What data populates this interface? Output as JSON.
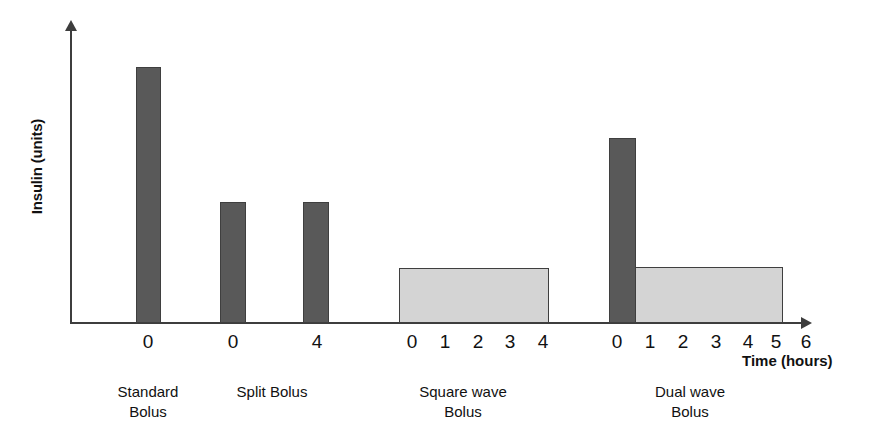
{
  "chart_data": {
    "type": "bar",
    "title": "",
    "subtitle": "",
    "xlabel": "Time (hours)",
    "ylabel": "Insulin (units)",
    "grid": false,
    "legend": "none",
    "xlim": [
      0,
      7
    ],
    "ylim": [
      0,
      10
    ],
    "note": "Schematic comparison of four insulin pump bolus delivery patterns; y-axis unlabeled (relative insulin units), x-axis shows hours after the bolus start for each pattern.",
    "groups": [
      {
        "name": "Standard Bolus",
        "caption_line1": "Standard",
        "caption_line2": "Bolus",
        "center_x": 148,
        "tick_labels": [
          "0"
        ],
        "bars": [
          {
            "label": "0",
            "kind": "immediate",
            "color": "#595959",
            "x_hours": 0,
            "duration_hours": 0.35,
            "value": 8.6
          }
        ]
      },
      {
        "name": "Split Bolus",
        "caption_line1": "Split Bolus",
        "caption_line2": "",
        "center_x": 272,
        "tick_labels": [
          "0",
          "4"
        ],
        "bars": [
          {
            "label": "0",
            "kind": "immediate",
            "color": "#595959",
            "x_hours": 0,
            "duration_hours": 0.35,
            "value": 4.0
          },
          {
            "label": "4",
            "kind": "immediate",
            "color": "#595959",
            "x_hours": 4,
            "duration_hours": 0.35,
            "value": 4.0
          }
        ]
      },
      {
        "name": "Square wave Bolus",
        "caption_line1": "Square wave",
        "caption_line2": "Bolus",
        "center_x": 463,
        "tick_labels": [
          "0",
          "1",
          "2",
          "3",
          "4"
        ],
        "bars": [
          {
            "label": "0-4",
            "kind": "extended",
            "color": "#d4d4d4",
            "x_hours": 0,
            "duration_hours": 4.5,
            "value": 1.8
          }
        ]
      },
      {
        "name": "Dual wave Bolus",
        "caption_line1": "Dual wave",
        "caption_line2": "Bolus",
        "center_x": 690,
        "tick_labels": [
          "0",
          "1",
          "2",
          "3",
          "4",
          "5",
          "6"
        ],
        "bars": [
          {
            "label": "0",
            "kind": "immediate",
            "color": "#595959",
            "x_hours": 0,
            "duration_hours": 0.9,
            "value": 6.2
          },
          {
            "label": "1-6",
            "kind": "extended",
            "color": "#d4d4d4",
            "x_hours": 1,
            "duration_hours": 5.5,
            "value": 1.85
          }
        ]
      }
    ],
    "colors": {
      "immediate_bolus": "#595959",
      "extended_bolus": "#d4d4d4",
      "axis": "#3d3d3d",
      "text": "#111111",
      "background": "#ffffff"
    }
  },
  "render": {
    "bars": [
      {
        "name": "bar-standard-0",
        "style": "bar-dark",
        "left": 136,
        "top": 67,
        "width": 25,
        "height": 256
      },
      {
        "name": "bar-split-0",
        "style": "bar-dark",
        "left": 220,
        "top": 202,
        "width": 26,
        "height": 121
      },
      {
        "name": "bar-split-4",
        "style": "bar-dark",
        "left": 303,
        "top": 202,
        "width": 26,
        "height": 121
      },
      {
        "name": "bar-squarewave-0-4",
        "style": "bar-light",
        "left": 399,
        "top": 268,
        "width": 150,
        "height": 55
      },
      {
        "name": "bar-dualwave-0",
        "style": "bar-dark",
        "left": 609,
        "top": 138,
        "width": 27,
        "height": 185
      },
      {
        "name": "bar-dualwave-1-6",
        "style": "bar-light",
        "left": 635,
        "top": 267,
        "width": 148,
        "height": 56
      }
    ],
    "ticks": [
      {
        "name": "tick-standard-0",
        "text": "0",
        "left": 148
      },
      {
        "name": "tick-split-0",
        "text": "0",
        "left": 233
      },
      {
        "name": "tick-split-4",
        "text": "4",
        "left": 317
      },
      {
        "name": "tick-square-0",
        "text": "0",
        "left": 412
      },
      {
        "name": "tick-square-1",
        "text": "1",
        "left": 445
      },
      {
        "name": "tick-square-2",
        "text": "2",
        "left": 478
      },
      {
        "name": "tick-square-3",
        "text": "3",
        "left": 510
      },
      {
        "name": "tick-square-4",
        "text": "4",
        "left": 543
      },
      {
        "name": "tick-dual-0",
        "text": "0",
        "left": 617
      },
      {
        "name": "tick-dual-1",
        "text": "1",
        "left": 650
      },
      {
        "name": "tick-dual-2",
        "text": "2",
        "left": 683
      },
      {
        "name": "tick-dual-3",
        "text": "3",
        "left": 716
      },
      {
        "name": "tick-dual-4",
        "text": "4",
        "left": 748
      },
      {
        "name": "tick-dual-5",
        "text": "5",
        "left": 776
      },
      {
        "name": "tick-dual-6",
        "text": "6",
        "left": 806
      }
    ],
    "captions": [
      {
        "name": "caption-standard",
        "left": 148,
        "line1": "Standard",
        "line2": "Bolus"
      },
      {
        "name": "caption-split",
        "left": 272,
        "line1": "Split Bolus",
        "line2": ""
      },
      {
        "name": "caption-squarewave",
        "left": 463,
        "line1": "Square wave",
        "line2": "Bolus"
      },
      {
        "name": "caption-dualwave",
        "left": 690,
        "line1": "Dual wave",
        "line2": "Bolus"
      }
    ]
  }
}
